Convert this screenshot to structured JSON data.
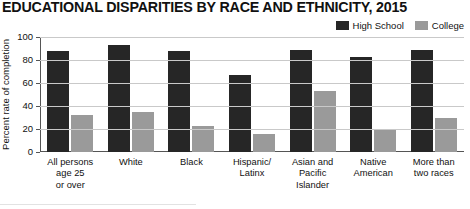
{
  "chart_data": {
    "type": "bar",
    "title": "EDUCATIONAL DISPARITIES BY RACE AND ETHNICITY, 2015",
    "xlabel": "",
    "ylabel": "Percent rate of completion",
    "ylim": [
      0,
      100
    ],
    "yticks": [
      0,
      20,
      40,
      60,
      80,
      100
    ],
    "grid": true,
    "legend_position": "top-right",
    "categories": [
      "All persons\nage 25\nor over",
      "White",
      "Black",
      "Hispanic/\nLatinx",
      "Asian and\nPacific\nIslander",
      "Native\nAmerican",
      "More than\ntwo races"
    ],
    "series": [
      {
        "name": "High School",
        "color": "#262626",
        "values": [
          88,
          93,
          88,
          67,
          89,
          83,
          89
        ]
      },
      {
        "name": "College",
        "color": "#9a9a9a",
        "values": [
          32,
          35,
          23,
          16,
          53,
          20,
          30
        ]
      }
    ]
  },
  "legend": {
    "items": [
      {
        "label": "High School",
        "color": "#262626"
      },
      {
        "label": "College",
        "color": "#9a9a9a"
      }
    ]
  },
  "axis": {
    "y_tick_labels": [
      "100",
      "80",
      "60",
      "40",
      "20",
      "0"
    ],
    "y_axis_title": "Percent rate of completion"
  },
  "x_categories": [
    {
      "lines": [
        "All persons",
        "age 25",
        "or over"
      ]
    },
    {
      "lines": [
        "White"
      ]
    },
    {
      "lines": [
        "Black"
      ]
    },
    {
      "lines": [
        "Hispanic/",
        "Latinx"
      ]
    },
    {
      "lines": [
        "Asian and",
        "Pacific",
        "Islander"
      ]
    },
    {
      "lines": [
        "Native",
        "American"
      ]
    },
    {
      "lines": [
        "More than",
        "two races"
      ]
    }
  ]
}
